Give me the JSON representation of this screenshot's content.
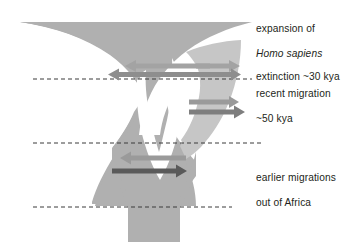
{
  "figure": {
    "width": 354,
    "height": 244,
    "background": "#ffffff"
  },
  "labels": {
    "expansion": {
      "line1": "expansion of",
      "line2": "Homo sapiens",
      "line2_style": "italic"
    },
    "extinction": "extinction ~30 kya",
    "recent_migration": {
      "line1": "recent migration",
      "line2": "~50 kya"
    },
    "earlier_migrations": {
      "line1": "earlier migrations",
      "line2": "out of Africa"
    }
  },
  "colors": {
    "funnel_main": "#b0b0b0",
    "funnel_branch": "#c6c6c6",
    "arrow_light": "#a3a3a3",
    "arrow_mid": "#8e8e8e",
    "arrow_dark": "#6e6e6e",
    "arrow_darkest": "#5a5a5a",
    "dashed_line": "#3a3a3a",
    "text": "#231f20",
    "background": "#ffffff"
  },
  "dashed_lines": [
    {
      "name": "recent-migration-line",
      "y": 79,
      "x_start": 33,
      "x_end": 252
    },
    {
      "name": "mid-line",
      "y": 143,
      "x_start": 33,
      "x_end": 262
    },
    {
      "name": "bottom-line",
      "y": 207,
      "x_start": 33,
      "x_end": 232
    }
  ],
  "arrows": [
    {
      "name": "extinction-arrow-left",
      "direction": "left",
      "x_start": 205,
      "x_end": 126,
      "y": 66,
      "color": "#a3a3a3"
    },
    {
      "name": "extinction-arrow-right-upper",
      "direction": "right",
      "x_start": 196,
      "x_end": 238,
      "y": 66,
      "color": "#a3a3a3"
    },
    {
      "name": "recent-migration-arrow-left",
      "direction": "left",
      "x_start": 210,
      "x_end": 110,
      "y": 74,
      "color": "#8e8e8e"
    },
    {
      "name": "recent-migration-arrow-right",
      "direction": "right",
      "x_start": 196,
      "x_end": 240,
      "y": 74,
      "color": "#8e8e8e"
    },
    {
      "name": "branch-arrow-upper",
      "direction": "right",
      "x_start": 190,
      "x_end": 240,
      "y": 102,
      "color": "#8e8e8e"
    },
    {
      "name": "branch-arrow-lower",
      "direction": "right",
      "x_start": 190,
      "x_end": 244,
      "y": 112,
      "color": "#7e7e7e"
    },
    {
      "name": "earlier-migration-arrow-left",
      "direction": "left",
      "x_start": 184,
      "x_end": 122,
      "y": 158,
      "color": "#9a9a9a"
    },
    {
      "name": "earlier-migration-arrow-right",
      "direction": "right",
      "x_start": 113,
      "x_end": 184,
      "y": 171,
      "color": "#5a5a5a"
    }
  ]
}
